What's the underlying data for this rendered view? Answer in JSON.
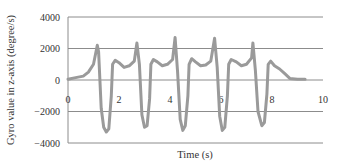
{
  "chart_data": {
    "type": "line",
    "title": "",
    "xlabel": "Time (s)",
    "ylabel": "Gyro value in z-axis (degree/s)",
    "xlim": [
      0,
      10
    ],
    "ylim": [
      -4000,
      4000
    ],
    "xticks": [
      0,
      2,
      4,
      6,
      8,
      10
    ],
    "yticks": [
      4000,
      2000,
      0,
      -2000,
      -4000
    ],
    "xtick_labels": [
      "0",
      "2",
      "4",
      "6",
      "8",
      "10"
    ],
    "ytick_labels": [
      "4000",
      "2000",
      "0",
      "−2000",
      "−4000"
    ],
    "grid": "horizontal",
    "legend": null,
    "series": [
      {
        "name": "Gyro z",
        "color": "#9a9a9a",
        "x": [
          0.0,
          0.3,
          0.6,
          0.8,
          1.0,
          1.15,
          1.2,
          1.3,
          1.4,
          1.5,
          1.6,
          1.7,
          1.75,
          1.85,
          2.0,
          2.2,
          2.4,
          2.6,
          2.7,
          2.8,
          2.9,
          3.0,
          3.1,
          3.2,
          3.25,
          3.35,
          3.5,
          3.7,
          3.9,
          4.1,
          4.2,
          4.3,
          4.4,
          4.5,
          4.6,
          4.7,
          4.75,
          4.85,
          5.0,
          5.2,
          5.4,
          5.6,
          5.75,
          5.85,
          5.95,
          6.05,
          6.15,
          6.25,
          6.3,
          6.4,
          6.6,
          6.8,
          7.0,
          7.2,
          7.25,
          7.35,
          7.45,
          7.6,
          7.7,
          7.8,
          7.85,
          7.95,
          8.1,
          8.3,
          8.5,
          8.7,
          9.0,
          9.3
        ],
        "y": [
          50,
          150,
          250,
          500,
          1000,
          2200,
          1800,
          -1800,
          -3000,
          -3300,
          -3100,
          -1000,
          1000,
          1250,
          1100,
          800,
          900,
          1200,
          2350,
          1000,
          -2200,
          -3000,
          -2900,
          -1200,
          1000,
          1300,
          1150,
          900,
          1000,
          1300,
          2700,
          500,
          -2500,
          -3200,
          -2900,
          -1000,
          1000,
          1350,
          1150,
          900,
          950,
          1200,
          2650,
          800,
          -2300,
          -3200,
          -3000,
          -1000,
          1000,
          1300,
          1150,
          900,
          1000,
          1400,
          2350,
          600,
          -2000,
          -2900,
          -2700,
          -900,
          1000,
          1200,
          900,
          700,
          400,
          100,
          50,
          50
        ]
      }
    ]
  },
  "labels": {
    "xlabel": "Time (s)",
    "ylabel": "Gyro value in z-axis (degree/s)",
    "xticks": [
      "0",
      "2",
      "4",
      "6",
      "8",
      "10"
    ],
    "yticks": [
      "4000",
      "2000",
      "0",
      "−2000",
      "−4000"
    ]
  },
  "colors": {
    "line": "#9a9a9a",
    "grid": "#8c8c8c",
    "text": "#333333"
  }
}
